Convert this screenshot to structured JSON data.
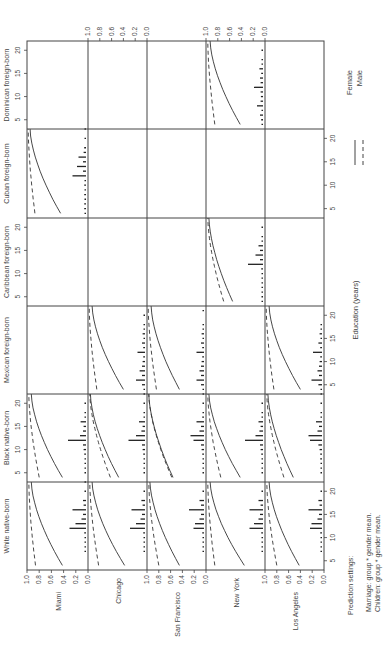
{
  "chart_data": {
    "type": "line",
    "orientation": "rotated-90-clockwise",
    "title": "",
    "xlabel": "Education (years)",
    "ylabel": "",
    "xlim": [
      3,
      22
    ],
    "ylim": [
      0.0,
      1.0
    ],
    "x_ticks": [
      5,
      10,
      15,
      20
    ],
    "y_ticks": [
      "1.0",
      "0.8",
      "0.6",
      "0.4",
      "0.2",
      "0.0"
    ],
    "grid": false,
    "legend": {
      "position": "right",
      "entries": [
        {
          "name": "Female",
          "style": "solid"
        },
        {
          "name": "Male",
          "style": "dashed"
        }
      ]
    },
    "group_labels": [
      "Dominican foreign-born",
      "Cuban foreign-born",
      "Caribbean foreign-born",
      "Mexican foreign-born",
      "Black native-born",
      "White native-born"
    ],
    "city_labels": [
      "Miami",
      "Chicago",
      "San Francisco",
      "New York",
      "Los Angeles"
    ],
    "x": [
      4,
      22
    ],
    "panels": [
      {
        "group": "Dominican foreign-born",
        "city": "New York",
        "female": [
          0.42,
          0.93
        ],
        "male": [
          0.85,
          0.97
        ],
        "hist": [
          [
            4,
            0.05
          ],
          [
            5,
            0.06
          ],
          [
            6,
            0.1
          ],
          [
            7,
            0.05
          ],
          [
            8,
            0.2
          ],
          [
            9,
            0.08
          ],
          [
            10,
            0.07
          ],
          [
            11,
            0.08
          ],
          [
            12,
            0.3
          ],
          [
            13,
            0.08
          ],
          [
            14,
            0.1
          ],
          [
            15,
            0.06
          ],
          [
            16,
            0.12
          ],
          [
            17,
            0.05
          ],
          [
            18,
            0.03
          ],
          [
            20,
            0.02
          ]
        ]
      },
      {
        "group": "Cuban foreign-born",
        "city": "Miami",
        "female": [
          0.45,
          0.95
        ],
        "male": [
          0.87,
          0.98
        ],
        "hist": [
          [
            4,
            0.05
          ],
          [
            5,
            0.06
          ],
          [
            6,
            0.06
          ],
          [
            7,
            0.05
          ],
          [
            8,
            0.06
          ],
          [
            9,
            0.05
          ],
          [
            10,
            0.06
          ],
          [
            11,
            0.05
          ],
          [
            12,
            0.45
          ],
          [
            13,
            0.1
          ],
          [
            14,
            0.3
          ],
          [
            15,
            0.1
          ],
          [
            16,
            0.25
          ],
          [
            17,
            0.08
          ],
          [
            18,
            0.06
          ],
          [
            20,
            0.04
          ],
          [
            22,
            0.02
          ]
        ]
      },
      {
        "group": "Caribbean foreign-born",
        "city": "New York",
        "female": [
          0.55,
          0.95
        ],
        "male": [
          0.7,
          0.97
        ],
        "hist": [
          [
            4,
            0.05
          ],
          [
            5,
            0.05
          ],
          [
            6,
            0.05
          ],
          [
            7,
            0.05
          ],
          [
            8,
            0.05
          ],
          [
            9,
            0.05
          ],
          [
            10,
            0.05
          ],
          [
            11,
            0.06
          ],
          [
            12,
            0.5
          ],
          [
            13,
            0.1
          ],
          [
            14,
            0.25
          ],
          [
            15,
            0.1
          ],
          [
            16,
            0.15
          ],
          [
            17,
            0.05
          ],
          [
            18,
            0.04
          ],
          [
            20,
            0.03
          ]
        ]
      },
      {
        "group": "Mexican foreign-born",
        "city": "Chicago",
        "female": [
          0.4,
          0.93
        ],
        "male": [
          0.85,
          0.98
        ],
        "hist": [
          [
            3,
            0.04
          ],
          [
            4,
            0.05
          ],
          [
            5,
            0.1
          ],
          [
            6,
            0.3
          ],
          [
            7,
            0.1
          ],
          [
            8,
            0.18
          ],
          [
            9,
            0.1
          ],
          [
            10,
            0.08
          ],
          [
            11,
            0.06
          ],
          [
            12,
            0.25
          ],
          [
            13,
            0.06
          ],
          [
            14,
            0.1
          ],
          [
            15,
            0.05
          ],
          [
            16,
            0.08
          ],
          [
            17,
            0.04
          ],
          [
            18,
            0.03
          ],
          [
            20,
            0.02
          ]
        ]
      },
      {
        "group": "Mexican foreign-born",
        "city": "San Francisco",
        "female": [
          0.45,
          0.93
        ],
        "male": [
          0.84,
          0.98
        ],
        "hist": [
          [
            3,
            0.04
          ],
          [
            4,
            0.05
          ],
          [
            5,
            0.1
          ],
          [
            6,
            0.25
          ],
          [
            7,
            0.1
          ],
          [
            8,
            0.15
          ],
          [
            9,
            0.1
          ],
          [
            10,
            0.08
          ],
          [
            11,
            0.06
          ],
          [
            12,
            0.25
          ],
          [
            13,
            0.06
          ],
          [
            14,
            0.1
          ],
          [
            15,
            0.05
          ],
          [
            16,
            0.08
          ],
          [
            17,
            0.04
          ],
          [
            18,
            0.03
          ],
          [
            21,
            0.02
          ]
        ]
      },
      {
        "group": "Mexican foreign-born",
        "city": "Los Angeles",
        "female": [
          0.4,
          0.93
        ],
        "male": [
          0.85,
          0.98
        ],
        "hist": [
          [
            3,
            0.04
          ],
          [
            4,
            0.05
          ],
          [
            5,
            0.12
          ],
          [
            6,
            0.35
          ],
          [
            7,
            0.1
          ],
          [
            8,
            0.15
          ],
          [
            9,
            0.1
          ],
          [
            10,
            0.08
          ],
          [
            11,
            0.06
          ],
          [
            12,
            0.3
          ],
          [
            13,
            0.06
          ],
          [
            14,
            0.12
          ],
          [
            15,
            0.05
          ],
          [
            16,
            0.08
          ],
          [
            17,
            0.04
          ],
          [
            18,
            0.03
          ]
        ]
      },
      {
        "group": "Black native-born",
        "city": "Miami",
        "female": [
          0.42,
          0.93
        ],
        "male": [
          0.8,
          0.97
        ],
        "hist": [
          [
            5,
            0.04
          ],
          [
            6,
            0.05
          ],
          [
            7,
            0.05
          ],
          [
            8,
            0.05
          ],
          [
            9,
            0.06
          ],
          [
            10,
            0.08
          ],
          [
            11,
            0.1
          ],
          [
            12,
            0.6
          ],
          [
            13,
            0.2
          ],
          [
            14,
            0.1
          ],
          [
            15,
            0.08
          ],
          [
            16,
            0.18
          ],
          [
            17,
            0.05
          ],
          [
            18,
            0.04
          ],
          [
            20,
            0.03
          ]
        ]
      },
      {
        "group": "Black native-born",
        "city": "Chicago",
        "female": [
          0.48,
          0.96
        ],
        "male": [
          0.62,
          0.97
        ],
        "hist": [
          [
            5,
            0.04
          ],
          [
            6,
            0.05
          ],
          [
            7,
            0.05
          ],
          [
            8,
            0.05
          ],
          [
            9,
            0.06
          ],
          [
            10,
            0.08
          ],
          [
            11,
            0.1
          ],
          [
            12,
            0.55
          ],
          [
            13,
            0.3
          ],
          [
            14,
            0.12
          ],
          [
            15,
            0.08
          ],
          [
            16,
            0.2
          ],
          [
            17,
            0.05
          ],
          [
            18,
            0.04
          ],
          [
            20,
            0.03
          ]
        ]
      },
      {
        "group": "Black native-born",
        "city": "San Francisco",
        "female": [
          0.56,
          0.97
        ],
        "male": [
          0.58,
          0.97
        ],
        "hist": [
          [
            5,
            0.04
          ],
          [
            6,
            0.05
          ],
          [
            7,
            0.05
          ],
          [
            8,
            0.05
          ],
          [
            9,
            0.06
          ],
          [
            10,
            0.08
          ],
          [
            11,
            0.1
          ],
          [
            12,
            0.35
          ],
          [
            13,
            0.45
          ],
          [
            14,
            0.15
          ],
          [
            15,
            0.1
          ],
          [
            16,
            0.25
          ],
          [
            17,
            0.06
          ],
          [
            18,
            0.05
          ],
          [
            20,
            0.04
          ]
        ]
      },
      {
        "group": "Black native-born",
        "city": "New York",
        "female": [
          0.42,
          0.95
        ],
        "male": [
          0.75,
          0.97
        ],
        "hist": [
          [
            5,
            0.04
          ],
          [
            6,
            0.05
          ],
          [
            7,
            0.05
          ],
          [
            8,
            0.05
          ],
          [
            9,
            0.06
          ],
          [
            10,
            0.08
          ],
          [
            11,
            0.1
          ],
          [
            12,
            0.6
          ],
          [
            13,
            0.25
          ],
          [
            14,
            0.12
          ],
          [
            15,
            0.08
          ],
          [
            16,
            0.15
          ],
          [
            17,
            0.05
          ],
          [
            18,
            0.04
          ],
          [
            20,
            0.03
          ]
        ]
      },
      {
        "group": "Black native-born",
        "city": "Los Angeles",
        "female": [
          0.52,
          0.95
        ],
        "male": [
          0.68,
          0.97
        ],
        "hist": [
          [
            5,
            0.04
          ],
          [
            6,
            0.05
          ],
          [
            7,
            0.05
          ],
          [
            8,
            0.06
          ],
          [
            9,
            0.06
          ],
          [
            10,
            0.08
          ],
          [
            11,
            0.12
          ],
          [
            12,
            0.4
          ],
          [
            13,
            0.45
          ],
          [
            14,
            0.15
          ],
          [
            15,
            0.1
          ],
          [
            16,
            0.2
          ],
          [
            17,
            0.05
          ],
          [
            18,
            0.04
          ],
          [
            20,
            0.03
          ]
        ]
      },
      {
        "group": "White native-born",
        "city": "Miami",
        "female": [
          0.42,
          0.93
        ],
        "male": [
          0.86,
          0.97
        ],
        "hist": [
          [
            7,
            0.03
          ],
          [
            8,
            0.04
          ],
          [
            9,
            0.04
          ],
          [
            10,
            0.05
          ],
          [
            11,
            0.06
          ],
          [
            12,
            0.55
          ],
          [
            13,
            0.35
          ],
          [
            14,
            0.15
          ],
          [
            15,
            0.1
          ],
          [
            16,
            0.45
          ],
          [
            17,
            0.08
          ],
          [
            18,
            0.1
          ],
          [
            20,
            0.04
          ],
          [
            22,
            0.02
          ]
        ]
      },
      {
        "group": "White native-born",
        "city": "Chicago",
        "female": [
          0.38,
          0.93
        ],
        "male": [
          0.82,
          0.97
        ],
        "hist": [
          [
            7,
            0.03
          ],
          [
            8,
            0.04
          ],
          [
            9,
            0.04
          ],
          [
            10,
            0.05
          ],
          [
            11,
            0.06
          ],
          [
            12,
            0.5
          ],
          [
            13,
            0.3
          ],
          [
            14,
            0.15
          ],
          [
            15,
            0.1
          ],
          [
            16,
            0.45
          ],
          [
            17,
            0.08
          ],
          [
            18,
            0.12
          ],
          [
            20,
            0.04
          ]
        ]
      },
      {
        "group": "White native-born",
        "city": "San Francisco",
        "female": [
          0.45,
          0.95
        ],
        "male": [
          0.8,
          0.97
        ],
        "hist": [
          [
            7,
            0.03
          ],
          [
            8,
            0.04
          ],
          [
            9,
            0.04
          ],
          [
            10,
            0.05
          ],
          [
            11,
            0.06
          ],
          [
            12,
            0.35
          ],
          [
            13,
            0.3
          ],
          [
            14,
            0.15
          ],
          [
            15,
            0.1
          ],
          [
            16,
            0.5
          ],
          [
            17,
            0.1
          ],
          [
            18,
            0.15
          ],
          [
            20,
            0.05
          ]
        ]
      },
      {
        "group": "White native-born",
        "city": "New York",
        "female": [
          0.35,
          0.93
        ],
        "male": [
          0.85,
          0.97
        ],
        "hist": [
          [
            7,
            0.03
          ],
          [
            8,
            0.04
          ],
          [
            9,
            0.04
          ],
          [
            10,
            0.05
          ],
          [
            11,
            0.06
          ],
          [
            12,
            0.45
          ],
          [
            13,
            0.3
          ],
          [
            14,
            0.15
          ],
          [
            15,
            0.1
          ],
          [
            16,
            0.45
          ],
          [
            17,
            0.08
          ],
          [
            18,
            0.15
          ],
          [
            20,
            0.05
          ]
        ]
      },
      {
        "group": "White native-born",
        "city": "Los Angeles",
        "female": [
          0.42,
          0.93
        ],
        "male": [
          0.8,
          0.97
        ],
        "hist": [
          [
            7,
            0.03
          ],
          [
            8,
            0.04
          ],
          [
            9,
            0.04
          ],
          [
            10,
            0.05
          ],
          [
            11,
            0.06
          ],
          [
            12,
            0.4
          ],
          [
            13,
            0.35
          ],
          [
            14,
            0.15
          ],
          [
            15,
            0.1
          ],
          [
            16,
            0.45
          ],
          [
            17,
            0.08
          ],
          [
            18,
            0.12
          ],
          [
            20,
            0.05
          ]
        ]
      }
    ]
  },
  "footnote": {
    "heading": "Prediction settings:",
    "lines": [
      "Marriage: group * gender mean.",
      "Children: group * gender mean."
    ]
  }
}
